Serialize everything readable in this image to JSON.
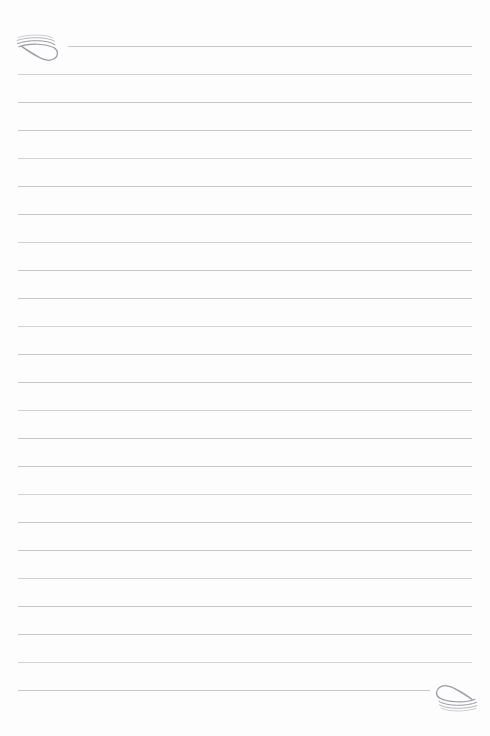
{
  "page": {
    "kind": "lined-notepaper",
    "background_color": "#fdfdfd",
    "rule_color": "#c4c4c8",
    "ornament_color": "#9a9aa2",
    "width_px": 490,
    "height_px": 736,
    "content_text": ""
  },
  "ruling": {
    "line_count": 24,
    "first_line_y": 46,
    "line_spacing_px": 28,
    "left_margin_x": 18,
    "right_margin_x": 472,
    "first_line_left_x": 68,
    "last_line_right_x": 430,
    "lines": [
      {
        "y": 46,
        "x1": 68,
        "x2": 472
      },
      {
        "y": 74,
        "x1": 18,
        "x2": 472
      },
      {
        "y": 102,
        "x1": 18,
        "x2": 472
      },
      {
        "y": 130,
        "x1": 18,
        "x2": 472
      },
      {
        "y": 158,
        "x1": 18,
        "x2": 472
      },
      {
        "y": 186,
        "x1": 18,
        "x2": 472
      },
      {
        "y": 214,
        "x1": 18,
        "x2": 472
      },
      {
        "y": 242,
        "x1": 18,
        "x2": 472
      },
      {
        "y": 270,
        "x1": 18,
        "x2": 472
      },
      {
        "y": 298,
        "x1": 18,
        "x2": 472
      },
      {
        "y": 326,
        "x1": 18,
        "x2": 472
      },
      {
        "y": 354,
        "x1": 18,
        "x2": 472
      },
      {
        "y": 382,
        "x1": 18,
        "x2": 472
      },
      {
        "y": 410,
        "x1": 18,
        "x2": 472
      },
      {
        "y": 438,
        "x1": 18,
        "x2": 472
      },
      {
        "y": 466,
        "x1": 18,
        "x2": 472
      },
      {
        "y": 494,
        "x1": 18,
        "x2": 472
      },
      {
        "y": 522,
        "x1": 18,
        "x2": 472
      },
      {
        "y": 550,
        "x1": 18,
        "x2": 472
      },
      {
        "y": 578,
        "x1": 18,
        "x2": 472
      },
      {
        "y": 606,
        "x1": 18,
        "x2": 472
      },
      {
        "y": 634,
        "x1": 18,
        "x2": 472
      },
      {
        "y": 662,
        "x1": 18,
        "x2": 472
      },
      {
        "y": 690,
        "x1": 18,
        "x2": 430
      }
    ]
  },
  "ornaments": [
    {
      "name": "flourish-top-left",
      "icon": "spiral-flourish-icon",
      "position": "top-left",
      "x": 12,
      "y": 29,
      "rotation_deg": 0
    },
    {
      "name": "flourish-bottom-right",
      "icon": "spiral-flourish-icon",
      "position": "bottom-right",
      "x": 426,
      "y": 683,
      "rotation_deg": 180
    }
  ]
}
